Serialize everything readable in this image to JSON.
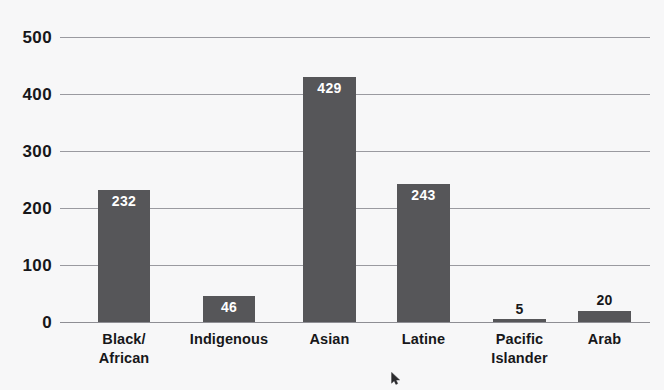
{
  "chart_data": {
    "type": "bar",
    "title": "",
    "subtitle": "",
    "xlabel": "",
    "ylabel": "",
    "ylim": [
      0,
      500
    ],
    "yticks": [
      0,
      100,
      200,
      300,
      400,
      500
    ],
    "ytick_labels": [
      "0",
      "100",
      "200",
      "300",
      "400",
      "500"
    ],
    "grid": true,
    "legend": null,
    "categories": [
      "Black/\nAfrican",
      "Indigenous",
      "Asian",
      "Latine",
      "Pacific\nIslander",
      "Arab"
    ],
    "values": [
      232,
      46,
      429,
      243,
      5,
      20
    ],
    "value_labels": [
      "232",
      "46",
      "429",
      "243",
      "5",
      "20"
    ],
    "bar_color": "#565659",
    "background_color": "#f7f7f8",
    "gridline_color": "#9a9aa0",
    "text_color": "#17171a",
    "inside_label_color": "#ffffff"
  },
  "bars": [
    {
      "label_line1": "Black/",
      "label_line2": "African",
      "value_label": "232",
      "value": 232,
      "left": 98,
      "width": 52,
      "label_inside": true
    },
    {
      "label_line1": "Indigenous",
      "label_line2": "",
      "value_label": "46",
      "value": 46,
      "left": 203,
      "width": 52,
      "label_inside": true
    },
    {
      "label_line1": "Asian",
      "label_line2": "",
      "value_label": "429",
      "value": 429,
      "left": 303,
      "width": 53,
      "label_inside": true
    },
    {
      "label_line1": "Latine",
      "label_line2": "",
      "value_label": "243",
      "value": 243,
      "left": 397,
      "width": 53,
      "label_inside": true
    },
    {
      "label_line1": "Pacific",
      "label_line2": "Islander",
      "value_label": "5",
      "value": 5,
      "left": 493,
      "width": 53,
      "label_inside": false
    },
    {
      "label_line1": "Arab",
      "label_line2": "",
      "value_label": "20",
      "value": 20,
      "left": 578,
      "width": 53,
      "label_inside": false
    }
  ],
  "axis": {
    "ytick_labels": [
      "500",
      "400",
      "300",
      "200",
      "100",
      "0"
    ]
  },
  "cursor": {
    "name": "mouse-pointer"
  }
}
